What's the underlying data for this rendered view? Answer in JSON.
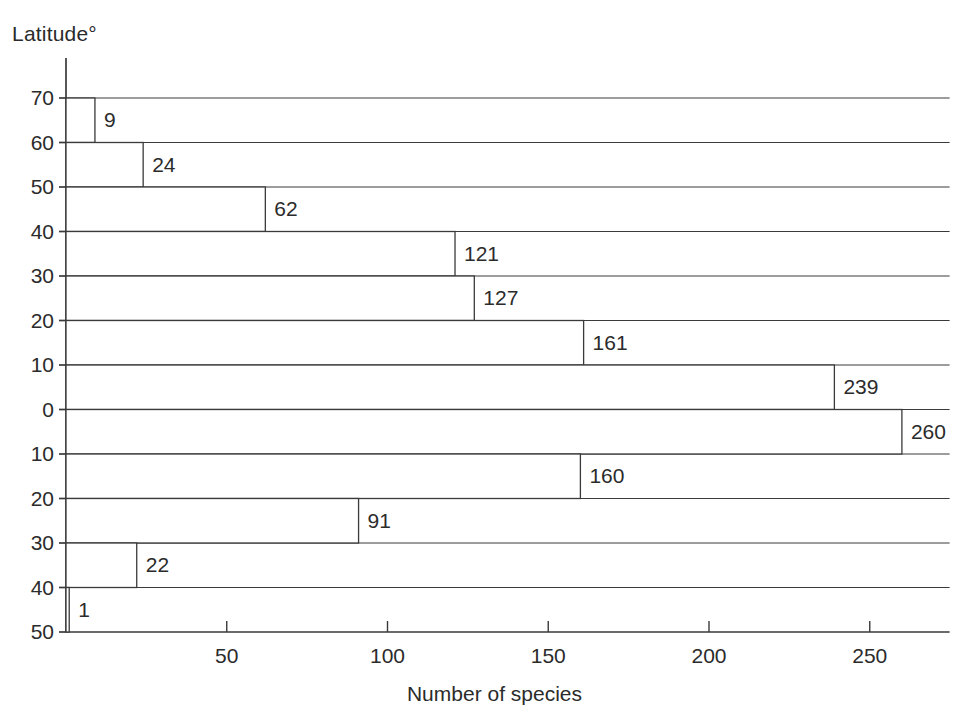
{
  "chart_data": {
    "type": "bar",
    "orientation": "horizontal",
    "title": "",
    "ylabel": "Latitude°",
    "xlabel": "Number of species",
    "categories": [
      "70–60",
      "60–50",
      "50–40",
      "40–30",
      "30–20",
      "20–10",
      "10–0",
      "0–10",
      "10–20",
      "20–30",
      "30–40",
      "40–50"
    ],
    "values": [
      9,
      24,
      62,
      121,
      127,
      161,
      239,
      260,
      160,
      91,
      22,
      1
    ],
    "value_labels": [
      "9",
      "24",
      "62",
      "121",
      "127",
      "161",
      "239",
      "260",
      "160",
      "91",
      "22",
      "1"
    ],
    "ytick_labels": [
      "70",
      "60",
      "50",
      "40",
      "30",
      "20",
      "10",
      "0",
      "10",
      "20",
      "30",
      "40",
      "50"
    ],
    "ytick_values": [
      70,
      60,
      50,
      40,
      30,
      20,
      10,
      0,
      -10,
      -20,
      -30,
      -40,
      -50
    ],
    "xtick_labels": [
      "50",
      "100",
      "150",
      "200",
      "250"
    ],
    "xtick_values": [
      50,
      100,
      150,
      200,
      250
    ],
    "xlim": [
      0,
      268
    ],
    "ylim": [
      -50,
      70
    ],
    "grid": true,
    "legend": false,
    "bar_fill": "#ffffff",
    "bar_stroke": "#3a3a3a",
    "axis_color": "#3a3a3a",
    "text_color": "#2b2b2b"
  }
}
